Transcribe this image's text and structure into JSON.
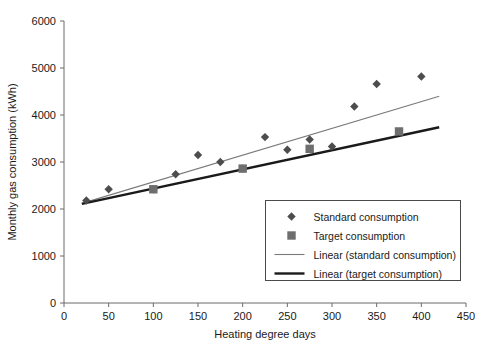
{
  "chart_data": {
    "type": "scatter",
    "title": "",
    "xlabel": "Heating degree days",
    "ylabel": "Monthly gas consumption (kWh)",
    "xlim": [
      0,
      450
    ],
    "ylim": [
      0,
      6000
    ],
    "xticks": [
      0,
      50,
      100,
      150,
      200,
      250,
      300,
      350,
      400,
      450
    ],
    "yticks": [
      0,
      1000,
      2000,
      3000,
      4000,
      5000,
      6000
    ],
    "grid": false,
    "legend_position": "inside-lower-right",
    "series": [
      {
        "name": "Standard consumption",
        "marker": "diamond",
        "color": "#4d4d4d",
        "points": [
          {
            "x": 25,
            "y": 2180
          },
          {
            "x": 50,
            "y": 2420
          },
          {
            "x": 100,
            "y": 2420
          },
          {
            "x": 125,
            "y": 2740
          },
          {
            "x": 150,
            "y": 3150
          },
          {
            "x": 175,
            "y": 3000
          },
          {
            "x": 200,
            "y": 2860
          },
          {
            "x": 225,
            "y": 3530
          },
          {
            "x": 250,
            "y": 3260
          },
          {
            "x": 275,
            "y": 3480
          },
          {
            "x": 300,
            "y": 3330
          },
          {
            "x": 325,
            "y": 4180
          },
          {
            "x": 350,
            "y": 4660
          },
          {
            "x": 400,
            "y": 4820
          }
        ]
      },
      {
        "name": "Target consumption",
        "marker": "square",
        "color": "#6e6e6e",
        "points": [
          {
            "x": 100,
            "y": 2420
          },
          {
            "x": 200,
            "y": 2860
          },
          {
            "x": 275,
            "y": 3280
          },
          {
            "x": 375,
            "y": 3650
          }
        ]
      },
      {
        "name": "Linear (standard consumption)",
        "marker": "line-thin",
        "color": "#7a7a7a",
        "fit": {
          "x0": 20,
          "y0": 2120,
          "x1": 420,
          "y1": 4400
        }
      },
      {
        "name": "Linear (target consumption)",
        "marker": "line-thick",
        "color": "#1a1a1a",
        "fit": {
          "x0": 20,
          "y0": 2110,
          "x1": 420,
          "y1": 3740
        }
      }
    ]
  },
  "legend": {
    "items": [
      {
        "label": "Standard consumption",
        "glyph": "diamond-marker"
      },
      {
        "label": "Target consumption",
        "glyph": "square-marker"
      },
      {
        "label": "Linear (standard consumption)",
        "glyph": "thin-line-swatch"
      },
      {
        "label": "Linear (target consumption)",
        "glyph": "thick-line-swatch"
      }
    ]
  },
  "axes": {
    "x_tick_labels": [
      "0",
      "50",
      "100",
      "150",
      "200",
      "250",
      "300",
      "350",
      "400",
      "450"
    ],
    "y_tick_labels": [
      "0",
      "1000",
      "2000",
      "3000",
      "4000",
      "5000",
      "6000"
    ]
  }
}
